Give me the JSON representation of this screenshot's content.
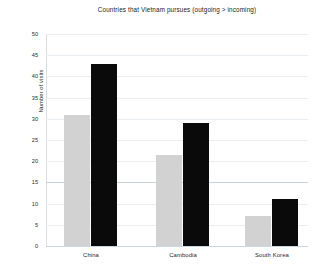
{
  "chart_data": {
    "type": "bar",
    "title": "Countries that Vietnam pursues (outgoing > incoming)",
    "xlabel": "",
    "ylabel": "Number of visits",
    "categories": [
      "China",
      "Cambodia",
      "South Korea"
    ],
    "series": [
      {
        "name": "incoming",
        "color": "#d2d2d2",
        "values": [
          31,
          21.5,
          7
        ]
      },
      {
        "name": "outgoing",
        "color": "#0a0a0a",
        "values": [
          43,
          29,
          11
        ]
      }
    ],
    "ylim": [
      0,
      50
    ],
    "ytick_step": 5,
    "yticks": [
      "50",
      "45",
      "40",
      "35",
      "30",
      "25",
      "20",
      "15",
      "10",
      "5",
      "0"
    ],
    "grid": true,
    "legend": "none"
  },
  "axis": {
    "y_title": "Number of visits"
  }
}
